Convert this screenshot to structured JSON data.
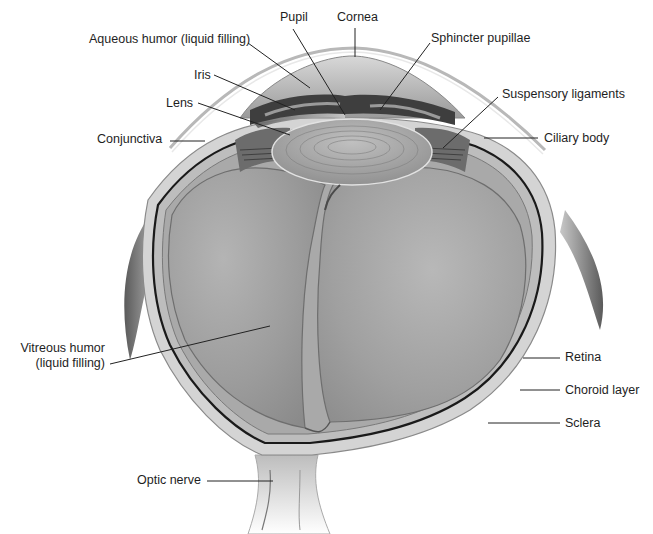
{
  "diagram": {
    "labels": {
      "pupil": "Pupil",
      "cornea": "Cornea",
      "aqueous_humor": "Aqueous humor (liquid filling)",
      "sphincter_pupillae": "Sphincter pupillae",
      "iris": "Iris",
      "lens": "Lens",
      "suspensory_ligaments": "Suspensory ligaments",
      "conjunctiva": "Conjunctiva",
      "ciliary_body": "Ciliary body",
      "vitreous_humor_line1": "Vitreous humor",
      "vitreous_humor_line2": "(liquid filling)",
      "retina": "Retina",
      "choroid_layer": "Choroid layer",
      "sclera": "Sclera",
      "optic_nerve": "Optic nerve"
    },
    "colors": {
      "background": "#ffffff",
      "leader_line": "#222222",
      "label_text": "#1e1e1e",
      "vitreous_fill": "#9a9a9a",
      "lens_fill": "#a8a8a8",
      "iris_fill": "#3c3c3c",
      "sclera_fill": "#cfcfcf"
    }
  }
}
